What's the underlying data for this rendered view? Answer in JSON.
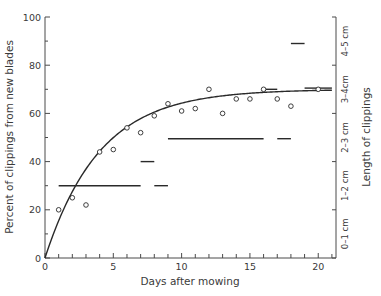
{
  "chart_data": {
    "type": "scatter",
    "title": "",
    "xlabel": "Days after mowing",
    "ylabel": "Percent of clippings from new blades",
    "ylabel_right": "Length of clippings",
    "xlim": [
      0,
      21.3
    ],
    "ylim": [
      0,
      100
    ],
    "x_ticks": [
      0,
      5,
      10,
      15,
      20
    ],
    "x_minor_ticks": [
      1,
      2,
      3,
      4,
      6,
      7,
      8,
      9,
      11,
      12,
      13,
      14,
      16,
      17,
      18,
      19,
      21
    ],
    "y_ticks": [
      0,
      20,
      40,
      60,
      80,
      100
    ],
    "y_minor_ticks": [
      10,
      30,
      50,
      70,
      90
    ],
    "right_axis_ticks": [
      0,
      20,
      40,
      60,
      80,
      100
    ],
    "right_axis_labels": [
      {
        "label": "0–1 cm",
        "y": 10
      },
      {
        "label": "1–2 cm",
        "y": 30
      },
      {
        "label": "2–3 cm",
        "y": 50
      },
      {
        "label": "3–4cm",
        "y": 70
      },
      {
        "label": "4–5 cm",
        "y": 90
      }
    ],
    "grid": false,
    "legend": null,
    "series": [
      {
        "name": "Percent of clippings from new blades",
        "marker": "open-circle",
        "points": [
          [
            1,
            20
          ],
          [
            2,
            25
          ],
          [
            3,
            22
          ],
          [
            4,
            44
          ],
          [
            5,
            45
          ],
          [
            6,
            54
          ],
          [
            7,
            52
          ],
          [
            8,
            59
          ],
          [
            9,
            64
          ],
          [
            10,
            61
          ],
          [
            11,
            62
          ],
          [
            12,
            70
          ],
          [
            13,
            60
          ],
          [
            14,
            66
          ],
          [
            15,
            66
          ],
          [
            16,
            70
          ],
          [
            17,
            66
          ],
          [
            18,
            63
          ],
          [
            20,
            70
          ]
        ]
      },
      {
        "name": "Fitted curve",
        "type": "line",
        "formula": "y = 70 * (1 - exp(-x / 4))"
      },
      {
        "name": "Length of clippings (segments)",
        "type": "segments",
        "segments": [
          {
            "x0": 1,
            "x1": 7,
            "y": 30
          },
          {
            "x0": 7,
            "x1": 8,
            "y": 40
          },
          {
            "x0": 8,
            "x1": 9,
            "y": 30
          },
          {
            "x0": 9,
            "x1": 16,
            "y": 49.5
          },
          {
            "x0": 16,
            "x1": 17,
            "y": 70
          },
          {
            "x0": 17,
            "x1": 18,
            "y": 49.5
          },
          {
            "x0": 18,
            "x1": 19,
            "y": 89
          },
          {
            "x0": 19,
            "x1": 21,
            "y": 70.5
          }
        ]
      }
    ]
  },
  "colors": {
    "ink": "#2a2a2a",
    "axis": "#4a4a4a",
    "background": "#ffffff"
  }
}
